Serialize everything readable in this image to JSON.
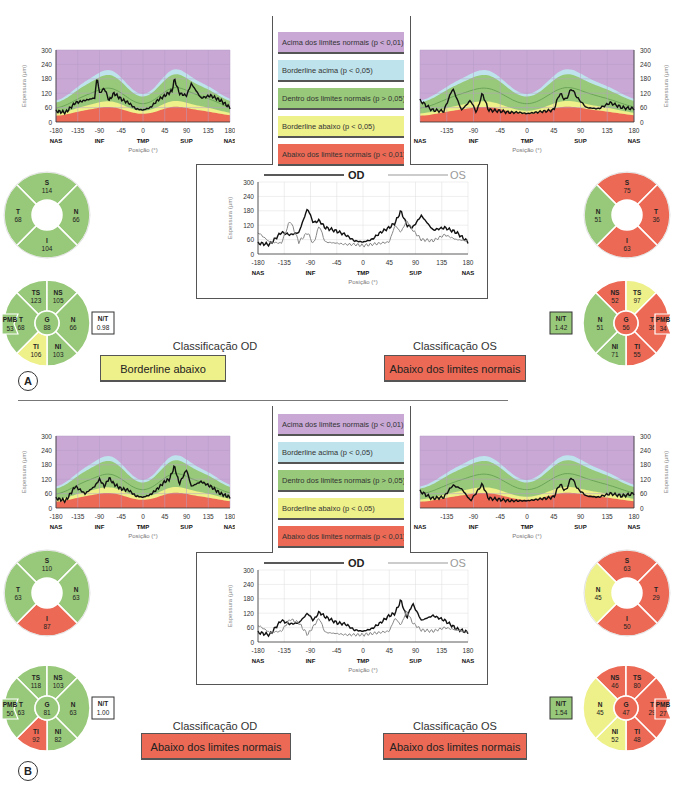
{
  "legend": {
    "items": [
      {
        "label": "Acima dos limites normais (p < 0,01)",
        "color": "#c9a8d6"
      },
      {
        "label": "Borderline acima (p < 0,05)",
        "color": "#bfe3ec"
      },
      {
        "label": "Dentro dos limites normais (p > 0,05)",
        "color": "#98c97a"
      },
      {
        "label": "Borderline abaixo (p < 0,05)",
        "color": "#eef08a"
      },
      {
        "label": "Abaixo dos limites normais (p < 0,01)",
        "color": "#ec6a55"
      }
    ]
  },
  "axes": {
    "ylabel": "Espessura (µm)",
    "xlabel": "Posição (°)",
    "yticks": [
      "300",
      "240",
      "180",
      "120",
      "60",
      "0"
    ],
    "xticks": [
      "-180",
      "-135",
      "-90",
      "-45",
      "0",
      "45",
      "90",
      "135",
      "180"
    ],
    "xticks_os": [
      "-135",
      "-90",
      "-45",
      "0",
      "45",
      "90",
      "135",
      "180"
    ],
    "regions": [
      "NAS",
      "INF",
      "TMP",
      "SUP",
      "NAS"
    ]
  },
  "combined_legend": {
    "od": "OD",
    "os": "OS"
  },
  "panels": [
    {
      "label": "A",
      "od": {
        "classification_title": "Classificação OD",
        "classification": "Borderline abaixo",
        "classification_color": "#eef08a",
        "quadrants": {
          "S": "114",
          "T": "68",
          "N": "66",
          "I": "104"
        },
        "quadrant_colors": {
          "S": "#98c97a",
          "T": "#98c97a",
          "N": "#98c97a",
          "I": "#98c97a"
        },
        "sectors": {
          "TS": "123",
          "NS": "105",
          "T": "68",
          "G": "88",
          "N": "66",
          "TI": "106",
          "NI": "103",
          "PMB": "53",
          "NT": "0.98"
        },
        "sector_colors": {
          "TS": "#98c97a",
          "NS": "#98c97a",
          "T": "#98c97a",
          "G": "#98c97a",
          "N": "#98c97a",
          "TI": "#eef08a",
          "NI": "#98c97a"
        }
      },
      "os": {
        "classification_title": "Classificação OS",
        "classification": "Abaixo dos limites normais",
        "classification_color": "#ec6a55",
        "quadrants": {
          "S": "75",
          "T": "36",
          "N": "51",
          "I": "63"
        },
        "quadrant_colors": {
          "S": "#ec6a55",
          "T": "#ec6a55",
          "N": "#98c97a",
          "I": "#ec6a55"
        },
        "sectors": {
          "NS": "52",
          "TS": "97",
          "N": "51",
          "G": "56",
          "T": "36",
          "NI": "71",
          "TI": "55",
          "PMB": "34",
          "NT": "1.42"
        },
        "sector_colors": {
          "NS": "#ec6a55",
          "TS": "#eef08a",
          "N": "#98c97a",
          "G": "#ec6a55",
          "T": "#ec6a55",
          "NI": "#98c97a",
          "TI": "#ec6a55"
        }
      }
    },
    {
      "label": "B",
      "od": {
        "classification_title": "Classificação OD",
        "classification": "Abaixo dos limites normais",
        "classification_color": "#ec6a55",
        "quadrants": {
          "S": "110",
          "T": "63",
          "N": "63",
          "I": "87"
        },
        "quadrant_colors": {
          "S": "#98c97a",
          "T": "#98c97a",
          "N": "#98c97a",
          "I": "#ec6a55"
        },
        "sectors": {
          "TS": "118",
          "NS": "103",
          "T": "63",
          "G": "81",
          "N": "63",
          "TI": "92",
          "NI": "82",
          "PMB": "50",
          "NT": "1.00"
        },
        "sector_colors": {
          "TS": "#98c97a",
          "NS": "#98c97a",
          "T": "#98c97a",
          "G": "#98c97a",
          "N": "#98c97a",
          "TI": "#ec6a55",
          "NI": "#98c97a"
        }
      },
      "os": {
        "classification_title": "Classificação OS",
        "classification": "Abaixo dos limites normais",
        "classification_color": "#ec6a55",
        "quadrants": {
          "S": "63",
          "T": "29",
          "N": "45",
          "I": "50"
        },
        "quadrant_colors": {
          "S": "#ec6a55",
          "T": "#ec6a55",
          "N": "#eef08a",
          "I": "#ec6a55"
        },
        "sectors": {
          "NS": "46",
          "TS": "80",
          "N": "45",
          "G": "47",
          "T": "29",
          "NI": "52",
          "TI": "48",
          "PMB": "27",
          "NT": "1.54"
        },
        "sector_colors": {
          "NS": "#ec6a55",
          "TS": "#ec6a55",
          "N": "#eef08a",
          "G": "#ec6a55",
          "T": "#ec6a55",
          "NI": "#eef08a",
          "TI": "#ec6a55"
        }
      }
    }
  ],
  "chart_data": [
    {
      "type": "area",
      "title": "Panel A OD TSNIT",
      "xlabel": "Posição (°)",
      "ylabel": "Espessura (µm)",
      "ylim": [
        0,
        300
      ],
      "x": [
        -180,
        -160,
        -140,
        -120,
        -100,
        -95,
        -90,
        -80,
        -70,
        -60,
        -45,
        -30,
        -15,
        0,
        15,
        30,
        45,
        60,
        65,
        75,
        90,
        100,
        120,
        140,
        160,
        180
      ],
      "series": [
        {
          "name": "OD",
          "values": [
            45,
            40,
            80,
            90,
            100,
            190,
            120,
            140,
            90,
            120,
            95,
            80,
            55,
            50,
            60,
            90,
            110,
            130,
            180,
            120,
            110,
            160,
            100,
            110,
            90,
            60
          ]
        }
      ]
    },
    {
      "type": "area",
      "title": "Panel A OS TSNIT",
      "xlabel": "Posição (°)",
      "ylabel": "Espessura (µm)",
      "ylim": [
        0,
        300
      ],
      "x": [
        -180,
        -160,
        -140,
        -125,
        -110,
        -95,
        -85,
        -75,
        -65,
        -45,
        -30,
        -15,
        0,
        15,
        30,
        45,
        55,
        65,
        75,
        85,
        100,
        120,
        140,
        160,
        180
      ],
      "series": [
        {
          "name": "OS",
          "values": [
            90,
            50,
            45,
            140,
            50,
            90,
            40,
            120,
            50,
            45,
            40,
            40,
            35,
            40,
            45,
            50,
            120,
            90,
            140,
            100,
            60,
            55,
            80,
            60,
            55
          ]
        }
      ]
    },
    {
      "type": "line",
      "title": "Panel A OD vs OS",
      "xlabel": "Posição (°)",
      "ylabel": "Espessura (µm)",
      "ylim": [
        0,
        300
      ],
      "x": [
        -180,
        -160,
        -140,
        -125,
        -110,
        -95,
        -85,
        -75,
        -65,
        -45,
        -30,
        -15,
        0,
        15,
        30,
        45,
        55,
        65,
        75,
        85,
        100,
        120,
        140,
        160,
        180
      ],
      "series": [
        {
          "name": "OD",
          "values": [
            45,
            40,
            90,
            80,
            90,
            190,
            130,
            140,
            110,
            95,
            80,
            55,
            50,
            60,
            90,
            110,
            130,
            180,
            120,
            110,
            160,
            100,
            110,
            90,
            50
          ]
        },
        {
          "name": "OS",
          "values": [
            90,
            50,
            45,
            140,
            50,
            90,
            40,
            120,
            50,
            45,
            40,
            40,
            35,
            40,
            45,
            50,
            120,
            90,
            140,
            100,
            60,
            55,
            80,
            60,
            55
          ]
        }
      ]
    },
    {
      "type": "area",
      "title": "Panel B OD TSNIT",
      "xlabel": "Posição (°)",
      "ylabel": "Espessura (µm)",
      "ylim": [
        0,
        300
      ],
      "x": [
        -180,
        -160,
        -140,
        -120,
        -100,
        -90,
        -80,
        -70,
        -60,
        -45,
        -30,
        -15,
        0,
        15,
        30,
        45,
        55,
        65,
        75,
        90,
        100,
        120,
        140,
        160,
        180
      ],
      "series": [
        {
          "name": "OD",
          "values": [
            40,
            30,
            90,
            60,
            90,
            120,
            90,
            125,
            100,
            80,
            75,
            50,
            45,
            55,
            80,
            110,
            120,
            175,
            100,
            160,
            90,
            110,
            90,
            60,
            45
          ]
        }
      ]
    },
    {
      "type": "area",
      "title": "Panel B OS TSNIT",
      "xlabel": "Posição (°)",
      "ylabel": "Espessura (µm)",
      "ylim": [
        0,
        300
      ],
      "x": [
        -180,
        -160,
        -140,
        -125,
        -110,
        -95,
        -85,
        -75,
        -65,
        -45,
        -30,
        -15,
        0,
        15,
        30,
        45,
        55,
        65,
        75,
        85,
        100,
        120,
        140,
        160,
        180
      ],
      "series": [
        {
          "name": "OS",
          "values": [
            70,
            40,
            45,
            95,
            80,
            30,
            65,
            100,
            40,
            35,
            30,
            30,
            30,
            35,
            40,
            45,
            100,
            70,
            130,
            80,
            50,
            45,
            60,
            50,
            60
          ]
        }
      ]
    },
    {
      "type": "line",
      "title": "Panel B OD vs OS",
      "xlabel": "Posição (°)",
      "ylabel": "Espessura (µm)",
      "ylim": [
        0,
        300
      ],
      "x": [
        -180,
        -160,
        -140,
        -125,
        -110,
        -95,
        -85,
        -75,
        -65,
        -45,
        -30,
        -15,
        0,
        15,
        30,
        45,
        55,
        65,
        75,
        85,
        100,
        120,
        140,
        160,
        180
      ],
      "series": [
        {
          "name": "OD",
          "values": [
            40,
            30,
            90,
            75,
            80,
            120,
            90,
            125,
            105,
            80,
            75,
            50,
            45,
            55,
            80,
            110,
            120,
            175,
            100,
            160,
            90,
            110,
            90,
            55,
            40
          ]
        },
        {
          "name": "OS",
          "values": [
            70,
            40,
            45,
            95,
            80,
            30,
            65,
            100,
            40,
            35,
            30,
            30,
            30,
            35,
            40,
            45,
            100,
            70,
            130,
            80,
            50,
            45,
            60,
            50,
            40
          ]
        }
      ]
    }
  ]
}
